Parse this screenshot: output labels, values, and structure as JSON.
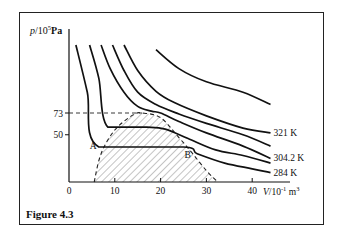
{
  "figure": {
    "caption": "Figure 4.3",
    "y_axis_label": "p / 10^5 Pa",
    "y_axis_label_parts": {
      "var": "p",
      "unit_base": "/10",
      "unit_exp": "5",
      "unit": "Pa"
    },
    "x_axis_label_parts": {
      "var": "V",
      "unit_base": "/10",
      "unit_exp": "-1",
      "unit2": "m",
      "unit2_exp": "3"
    },
    "point_labels": {
      "A": "A",
      "B": "B"
    }
  },
  "chart_data": {
    "type": "line",
    "title": "",
    "subtitle": "Isotherms of CO2 (p–V diagram)",
    "xlabel": "V / 10^-1 m^3",
    "ylabel": "p / 10^5 Pa",
    "xlim": [
      0,
      45
    ],
    "ylim": [
      0,
      160
    ],
    "x_ticks": [
      "0",
      "10",
      "20",
      "30",
      "40"
    ],
    "x_tick_values": [
      0,
      10,
      20,
      30,
      40
    ],
    "y_ticks": [
      "50",
      "73"
    ],
    "y_tick_values": [
      50,
      73
    ],
    "grid": false,
    "legend": "inline labels at right end of curves",
    "critical_pressure_dashed_line": 73,
    "isotherm_labels": [
      {
        "label": "321 K",
        "series_index": 1
      },
      {
        "label": "304.2 K",
        "series_index": 3
      },
      {
        "label": "284 K",
        "series_index": 5
      }
    ],
    "series": [
      {
        "name": "highest isotherm (unlabeled)",
        "points": [
          [
            19,
            140
          ],
          [
            24,
            120
          ],
          [
            30,
            106
          ],
          [
            38,
            95
          ],
          [
            44,
            82
          ]
        ]
      },
      {
        "name": "321 K",
        "points": [
          [
            12,
            145
          ],
          [
            15,
            118
          ],
          [
            19,
            96
          ],
          [
            23,
            84
          ],
          [
            30,
            70
          ],
          [
            38,
            57
          ],
          [
            44,
            52
          ]
        ]
      },
      {
        "name": "isotherm (unlabeled)",
        "points": [
          [
            9.5,
            145
          ],
          [
            12,
            118
          ],
          [
            15,
            95
          ],
          [
            19,
            82
          ],
          [
            24,
            72
          ],
          [
            30,
            62
          ],
          [
            38,
            50
          ],
          [
            44,
            38
          ]
        ]
      },
      {
        "name": "304.2 K",
        "points": [
          [
            7,
            145
          ],
          [
            9,
            120
          ],
          [
            12,
            95
          ],
          [
            15,
            80
          ],
          [
            18,
            75
          ],
          [
            20,
            73
          ],
          [
            24,
            64
          ],
          [
            30,
            52
          ],
          [
            38,
            38
          ],
          [
            44,
            25
          ]
        ]
      },
      {
        "name": "isotherm (unlabeled)",
        "points": [
          [
            4.5,
            145
          ],
          [
            6.5,
            110
          ],
          [
            8.5,
            58
          ],
          [
            17,
            58
          ],
          [
            21,
            56
          ],
          [
            26,
            46
          ],
          [
            32,
            34
          ],
          [
            38,
            28
          ],
          [
            44,
            20
          ]
        ]
      },
      {
        "name": "284 K",
        "points": [
          [
            1.5,
            145
          ],
          [
            4,
            95
          ],
          [
            6.5,
            37
          ],
          [
            25,
            37
          ],
          [
            28,
            30
          ],
          [
            34,
            20
          ],
          [
            40,
            14
          ],
          [
            44,
            10
          ]
        ]
      }
    ],
    "coexistence_dome": {
      "style": "dashed, hatched interior",
      "points": [
        [
          5.5,
          0
        ],
        [
          7,
          30
        ],
        [
          10,
          55
        ],
        [
          14,
          71
        ],
        [
          16,
          73
        ],
        [
          20,
          68
        ],
        [
          24,
          47
        ],
        [
          27,
          30
        ],
        [
          30,
          12
        ],
        [
          32.5,
          0
        ]
      ]
    },
    "annotations": [
      {
        "text": "A",
        "x": 6.5,
        "y": 37
      },
      {
        "text": "B",
        "x": 25,
        "y": 37
      }
    ]
  }
}
